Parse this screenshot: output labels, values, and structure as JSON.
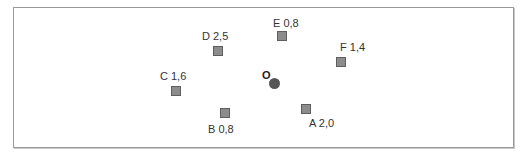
{
  "diagram": {
    "origin": {
      "label": "O",
      "x": 275,
      "y": 83
    },
    "points": [
      {
        "name": "A",
        "value": "2,0",
        "label": "A 2,0",
        "x": 306,
        "y": 109,
        "label_pos": "below"
      },
      {
        "name": "B",
        "value": "0,8",
        "label": "B 0,8",
        "x": 225,
        "y": 113,
        "label_pos": "below"
      },
      {
        "name": "C",
        "value": "1,6",
        "label": "C 1,6",
        "x": 176,
        "y": 91,
        "label_pos": "above"
      },
      {
        "name": "D",
        "value": "2,5",
        "label": "D 2,5",
        "x": 218,
        "y": 51,
        "label_pos": "above"
      },
      {
        "name": "E",
        "value": "0,8",
        "label": "E 0,8",
        "x": 282,
        "y": 36,
        "label_pos": "above"
      },
      {
        "name": "F",
        "value": "1,4",
        "label": "F 1,4",
        "x": 341,
        "y": 62,
        "label_pos": "above"
      }
    ],
    "colors": {
      "marker_fill": "#8c8c8c",
      "marker_border": "#5e5e5e",
      "origin": "#555555",
      "frame": "#9a9a9a"
    }
  }
}
